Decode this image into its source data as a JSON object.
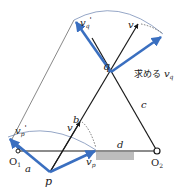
{
  "diagram": {
    "type": "linkage-velocity",
    "labels": {
      "vq_prime": "v",
      "vq_prime_sub": "q",
      "vq_prime_mark": "'",
      "v_top": "v",
      "q": "q",
      "find_vq_text": "求める ",
      "find_vq_v": "v",
      "find_vq_sub": "q",
      "c": "c",
      "b": "b",
      "d": "d",
      "v_mid": "v",
      "vp_prime": "v",
      "vp_prime_sub": "p",
      "vp_prime_mark": "'",
      "vp": "v",
      "vp_sub": "p",
      "O1": "O",
      "O1_sub": "1",
      "O2": "O",
      "O2_sub": "2",
      "a": "a",
      "p": "p"
    },
    "colors": {
      "blue": "#3a6fc0",
      "black": "#1a1a1a",
      "thin": "#555555",
      "arc": "#7a8fb8",
      "ground": "#bdbdbd"
    }
  }
}
